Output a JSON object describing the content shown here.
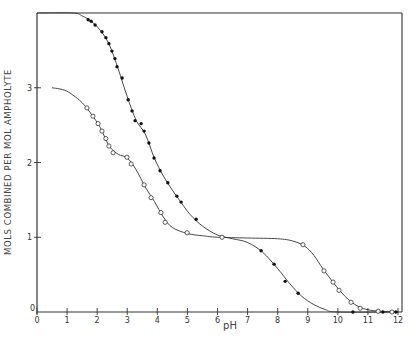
{
  "chart_data": {
    "type": "line",
    "title": "",
    "xlabel": "pH",
    "ylabel": "MOLS COMBINED PER MOL AMPHOLYTE",
    "xlim": [
      0,
      12
    ],
    "ylim": [
      0,
      4
    ],
    "x_ticks": [
      "0",
      "1",
      "2",
      "3",
      "4",
      "5",
      "6",
      "7",
      "8",
      "9",
      "10",
      "11",
      "12"
    ],
    "y_ticks": [
      "0",
      "1",
      "2",
      "3"
    ],
    "grid": false,
    "legend": null,
    "series": [
      {
        "name": "filled circles",
        "marker": "filled-circle",
        "points": [
          [
            1.7,
            3.91
          ],
          [
            1.8,
            3.89
          ],
          [
            1.93,
            3.84
          ],
          [
            2.16,
            3.75
          ],
          [
            2.29,
            3.67
          ],
          [
            2.39,
            3.59
          ],
          [
            2.49,
            3.49
          ],
          [
            2.59,
            3.39
          ],
          [
            2.66,
            3.28
          ],
          [
            2.83,
            3.13
          ],
          [
            3.03,
            2.84
          ],
          [
            3.16,
            2.69
          ],
          [
            3.26,
            2.56
          ],
          [
            3.46,
            2.52
          ],
          [
            3.56,
            2.42
          ],
          [
            3.72,
            2.26
          ],
          [
            3.89,
            2.06
          ],
          [
            4.09,
            1.89
          ],
          [
            4.35,
            1.73
          ],
          [
            4.65,
            1.55
          ],
          [
            4.79,
            1.47
          ],
          [
            5.29,
            1.24
          ],
          [
            6.15,
            1.0
          ],
          [
            7.45,
            0.82
          ],
          [
            7.88,
            0.64
          ],
          [
            8.25,
            0.41
          ],
          [
            8.68,
            0.25
          ],
          [
            10.5,
            0.0
          ],
          [
            11.5,
            0.0
          ],
          [
            11.8,
            0.0
          ],
          [
            11.93,
            0.0
          ]
        ]
      },
      {
        "name": "open circles",
        "marker": "open-circle",
        "points": [
          [
            1.66,
            2.73
          ],
          [
            1.86,
            2.62
          ],
          [
            2.03,
            2.52
          ],
          [
            2.16,
            2.42
          ],
          [
            2.29,
            2.32
          ],
          [
            2.39,
            2.22
          ],
          [
            2.53,
            2.13
          ],
          [
            2.99,
            2.07
          ],
          [
            3.13,
            1.98
          ],
          [
            3.56,
            1.7
          ],
          [
            3.79,
            1.53
          ],
          [
            4.12,
            1.33
          ],
          [
            4.26,
            1.2
          ],
          [
            4.99,
            1.06
          ],
          [
            6.15,
            1.0
          ],
          [
            8.84,
            0.9
          ],
          [
            9.54,
            0.55
          ],
          [
            9.84,
            0.4
          ],
          [
            10.04,
            0.29
          ],
          [
            10.44,
            0.13
          ],
          [
            10.74,
            0.05
          ],
          [
            11.34,
            0.01
          ],
          [
            11.8,
            0.0
          ]
        ]
      }
    ],
    "curves": {
      "filled_fit": [
        [
          0.0,
          4.0
        ],
        [
          1.2,
          4.0
        ],
        [
          1.5,
          3.96
        ],
        [
          1.8,
          3.89
        ],
        [
          2.1,
          3.77
        ],
        [
          2.4,
          3.58
        ],
        [
          2.7,
          3.25
        ],
        [
          3.0,
          2.88
        ],
        [
          3.3,
          2.56
        ],
        [
          3.6,
          2.38
        ],
        [
          3.9,
          2.06
        ],
        [
          4.2,
          1.82
        ],
        [
          4.5,
          1.63
        ],
        [
          4.8,
          1.46
        ],
        [
          5.1,
          1.3
        ],
        [
          5.5,
          1.15
        ],
        [
          6.0,
          1.03
        ],
        [
          6.5,
          0.98
        ],
        [
          7.0,
          0.93
        ],
        [
          7.5,
          0.8
        ],
        [
          8.0,
          0.58
        ],
        [
          8.4,
          0.38
        ],
        [
          8.8,
          0.21
        ],
        [
          9.2,
          0.1
        ],
        [
          9.6,
          0.03
        ],
        [
          10.0,
          0.0
        ],
        [
          12.0,
          0.0
        ]
      ],
      "open_fit": [
        [
          0.5,
          3.0
        ],
        [
          0.9,
          2.97
        ],
        [
          1.2,
          2.9
        ],
        [
          1.5,
          2.8
        ],
        [
          1.8,
          2.65
        ],
        [
          2.1,
          2.47
        ],
        [
          2.4,
          2.22
        ],
        [
          2.7,
          2.11
        ],
        [
          3.0,
          2.06
        ],
        [
          3.3,
          1.9
        ],
        [
          3.6,
          1.67
        ],
        [
          3.9,
          1.48
        ],
        [
          4.2,
          1.27
        ],
        [
          4.5,
          1.13
        ],
        [
          5.0,
          1.05
        ],
        [
          5.5,
          1.02
        ],
        [
          6.0,
          1.0
        ],
        [
          7.0,
          0.99
        ],
        [
          8.0,
          0.98
        ],
        [
          8.5,
          0.95
        ],
        [
          8.9,
          0.88
        ],
        [
          9.2,
          0.76
        ],
        [
          9.5,
          0.58
        ],
        [
          9.8,
          0.42
        ],
        [
          10.1,
          0.27
        ],
        [
          10.4,
          0.15
        ],
        [
          10.7,
          0.07
        ],
        [
          11.0,
          0.03
        ],
        [
          11.4,
          0.01
        ],
        [
          12.0,
          0.0
        ]
      ]
    },
    "frame": {
      "right_border": true,
      "top_border_at": 4
    }
  },
  "labels": {
    "ylabel": "MOLS COMBINED PER MOL AMPHOLYTE",
    "xlabel": "pH"
  },
  "colors": {
    "ink": "#333333",
    "background": "#ffffff"
  }
}
